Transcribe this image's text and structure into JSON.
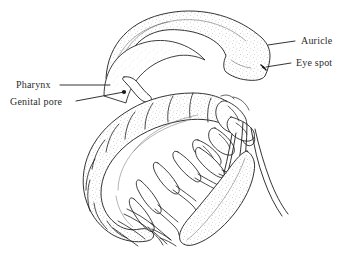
{
  "figure": {
    "background_color": "#ffffff",
    "ink_color": "#1a1a1a",
    "stipple_color": "#8a8a8a",
    "label_color": "#2b2b2b"
  },
  "labels": [
    {
      "id": "auricle",
      "text": "Auricle",
      "side": "right",
      "text_x": 301,
      "text_y": 35,
      "leader_from_x": 295,
      "leader_from_y": 41,
      "leader_to_x": 268,
      "leader_to_y": 45
    },
    {
      "id": "eye_spot",
      "text": "Eye spot",
      "side": "right",
      "text_x": 296,
      "text_y": 57,
      "leader_from_x": 291,
      "leader_from_y": 63,
      "leader_to_x": 266,
      "leader_to_y": 67
    },
    {
      "id": "pharynx",
      "text": "Pharynx",
      "side": "left",
      "text_x": 16,
      "text_y": 79,
      "leader_from_x": 60,
      "leader_from_y": 85,
      "leader_to_x": 110,
      "leader_to_y": 85
    },
    {
      "id": "genital_pore",
      "text": "Genital pore",
      "side": "left",
      "text_x": 10,
      "text_y": 96,
      "leader_from_x": 76,
      "leader_from_y": 101,
      "leader_to_x": 124,
      "leader_to_y": 92
    }
  ],
  "markers": [
    {
      "id": "genital-pore-dot",
      "shape": "filled-dot",
      "x": 124,
      "y": 92,
      "r": 2.1
    },
    {
      "id": "eye-spot-mark",
      "shape": "comma",
      "x": 264,
      "y": 68
    }
  ]
}
